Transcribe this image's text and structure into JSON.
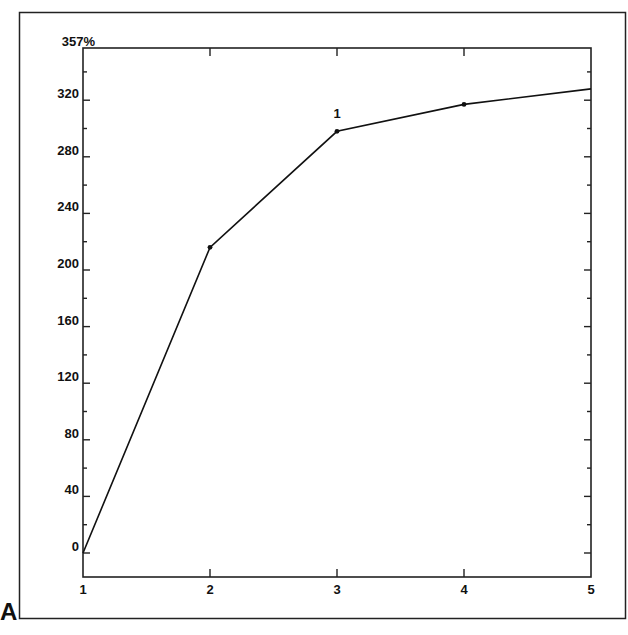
{
  "panel_label": "A",
  "chart_data": {
    "type": "line",
    "title": "",
    "xlabel": "",
    "ylabel": "",
    "x": [
      1,
      2,
      3,
      4,
      5
    ],
    "series": [
      {
        "name": "series-1",
        "values": [
          0,
          216,
          298,
          317,
          328
        ]
      }
    ],
    "xlim": [
      1,
      5
    ],
    "ylim": [
      -17,
      357
    ],
    "x_ticks": [
      1,
      2,
      3,
      4,
      5
    ],
    "y_ticks": [
      0,
      40,
      80,
      120,
      160,
      200,
      240,
      280,
      320
    ],
    "y_minor_step": 20,
    "y_top_label": "357%",
    "annotations": [
      {
        "text": "1",
        "x": 3,
        "y": 298
      }
    ],
    "grid": false,
    "legend": null
  },
  "colors": {
    "line": "#111111",
    "axis": "#222222",
    "background": "#ffffff"
  }
}
